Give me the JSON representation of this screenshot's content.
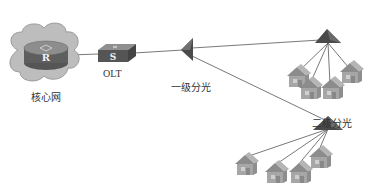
{
  "diagram": {
    "type": "PON network topology",
    "nodes": {
      "core": {
        "label": "核心网",
        "device_letter": "R",
        "icon": "router-in-cloud-icon"
      },
      "olt": {
        "label": "OLT",
        "device_letter": "S",
        "icon": "switch-icon"
      },
      "splitter1": {
        "label": "一级分光",
        "icon": "splitter-icon"
      },
      "splitter2a": {
        "label": "",
        "icon": "splitter-icon",
        "homes": 4
      },
      "splitter2b": {
        "label": "二级分光",
        "icon": "splitter-icon",
        "homes": 4
      }
    },
    "edges": [
      [
        "core",
        "olt"
      ],
      [
        "olt",
        "splitter1"
      ],
      [
        "splitter1",
        "splitter2a"
      ],
      [
        "splitter1",
        "splitter2b"
      ],
      [
        "splitter2a",
        "home x4"
      ],
      [
        "splitter2b",
        "home x4"
      ]
    ],
    "colors": {
      "cloud": "#b8b8b8",
      "device_top": "#8a8a8a",
      "device_side": "#555555",
      "splitter": "#4a4a4a",
      "house": "#a8a8a8",
      "line": "#555555"
    }
  }
}
